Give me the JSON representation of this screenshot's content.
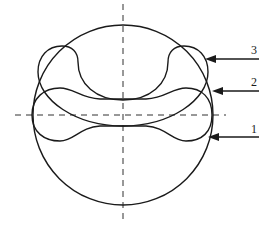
{
  "diagram": {
    "title": "",
    "labels": [
      {
        "id": "label-3",
        "text": "3",
        "points_to": "curve-3 (upper bowl/saddle profile)"
      },
      {
        "id": "label-2",
        "text": "2",
        "points_to": "curve-2 (outer circle)"
      },
      {
        "id": "label-1",
        "text": "1",
        "points_to": "curve-1 (dog-bone / peanut profile)"
      }
    ],
    "center_lines": [
      "vertical dashed axis",
      "horizontal dashed axis"
    ],
    "colors": {
      "line": "#1a1a1a",
      "background": "#ffffff"
    }
  }
}
